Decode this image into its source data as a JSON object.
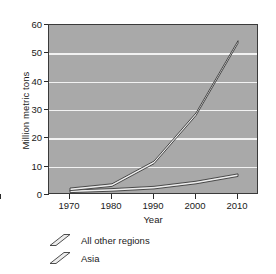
{
  "chart_data": {
    "type": "line",
    "title": "",
    "xlabel": "Year",
    "ylabel": "Million metric tons",
    "x": [
      1970,
      1980,
      1990,
      2000,
      2010
    ],
    "xtick_labels": [
      "1970",
      "1980",
      "1990",
      "2000",
      "2010"
    ],
    "ytick_labels": [
      "0",
      "10",
      "20",
      "30",
      "40",
      "50",
      "60"
    ],
    "yticks": [
      0,
      10,
      20,
      30,
      40,
      50,
      60
    ],
    "xlim": [
      1965,
      2015
    ],
    "ylim": [
      0,
      60
    ],
    "grid": "horizontal",
    "legend_position": "below-left",
    "plot_background": "#a9a9a9",
    "gridline_color": "#f2f2f2",
    "line_color": "#3a3a3a",
    "line_fill": "#ededed",
    "series": [
      {
        "name": "All other regions",
        "values": [
          1.3,
          1.8,
          2.6,
          4.4,
          7.0
        ]
      },
      {
        "name": "Asia",
        "values": [
          2.0,
          3.5,
          11.5,
          28.5,
          54.0
        ]
      }
    ]
  },
  "legend": {
    "items": [
      {
        "label": "All other regions",
        "marker": "diagonal-ribbon-icon"
      },
      {
        "label": "Asia",
        "marker": "diagonal-ribbon-icon"
      }
    ]
  }
}
